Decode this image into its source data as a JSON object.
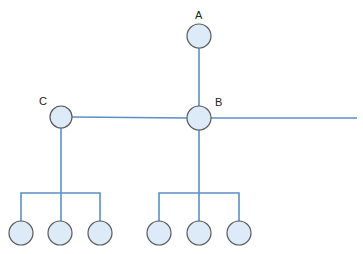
{
  "diagram": {
    "type": "tree-network",
    "colors": {
      "edge": "#5b8fc7",
      "node_fill": "#dcebf7",
      "node_stroke": "#5a5a5a",
      "label": "#222222"
    },
    "nodes": [
      {
        "id": "A",
        "label": "A",
        "cx": 199,
        "cy": 36,
        "r": 12,
        "label_x": 195,
        "label_y": 19
      },
      {
        "id": "B",
        "label": "B",
        "cx": 199,
        "cy": 118,
        "r": 12,
        "label_x": 215,
        "label_y": 106
      },
      {
        "id": "C",
        "label": "C",
        "cx": 61,
        "cy": 117,
        "r": 11,
        "label_x": 39,
        "label_y": 105
      },
      {
        "id": "C1",
        "label": "",
        "cx": 21,
        "cy": 233,
        "r": 12
      },
      {
        "id": "C2",
        "label": "",
        "cx": 60,
        "cy": 233,
        "r": 12
      },
      {
        "id": "C3",
        "label": "",
        "cx": 100,
        "cy": 233,
        "r": 12
      },
      {
        "id": "B1",
        "label": "",
        "cx": 159,
        "cy": 233,
        "r": 12
      },
      {
        "id": "B2",
        "label": "",
        "cx": 199,
        "cy": 233,
        "r": 12
      },
      {
        "id": "B3",
        "label": "",
        "cx": 239,
        "cy": 233,
        "r": 12
      }
    ],
    "edges": [
      {
        "from": "A",
        "to": "B"
      },
      {
        "from": "C",
        "to": "B"
      },
      {
        "from": "B",
        "to": "right-edge"
      },
      {
        "from": "C",
        "to": "C1"
      },
      {
        "from": "C",
        "to": "C2"
      },
      {
        "from": "C",
        "to": "C3"
      },
      {
        "from": "B",
        "to": "B1"
      },
      {
        "from": "B",
        "to": "B2"
      },
      {
        "from": "B",
        "to": "B3"
      }
    ]
  }
}
